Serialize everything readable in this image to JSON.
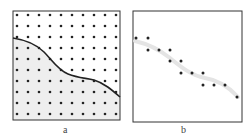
{
  "panels": [
    {
      "id": "a",
      "caption": "a",
      "box": {
        "x": 13,
        "y": 11,
        "w": 107,
        "h": 109
      },
      "grid": {
        "cols": 10,
        "rows": 10,
        "x0": 17,
        "y0": 15,
        "dx": 11,
        "dy": 11
      },
      "boundary_curve": "M13,38 C26,40 36,44 44,52 C52,60 58,70 68,74 C78,78 86,78 94,80 C104,83 112,90 120,97",
      "fill_color": "#eeeeee",
      "stroke_color": "#222222"
    },
    {
      "id": "b",
      "caption": "b",
      "box": {
        "x": 133,
        "y": 11,
        "w": 109,
        "h": 111
      },
      "points": [
        [
          136,
          38
        ],
        [
          148,
          38
        ],
        [
          148,
          50
        ],
        [
          159,
          50
        ],
        [
          170,
          50
        ],
        [
          170,
          61
        ],
        [
          181,
          61
        ],
        [
          181,
          73
        ],
        [
          192,
          73
        ],
        [
          203,
          73
        ],
        [
          203,
          85
        ],
        [
          214,
          85
        ],
        [
          225,
          85
        ],
        [
          237,
          97
        ]
      ],
      "trend_curve": "M135,41 C148,44 160,50 170,58 C180,66 190,75 205,78 C218,80 228,86 238,97",
      "trend_color": "#e4e4e4"
    }
  ]
}
